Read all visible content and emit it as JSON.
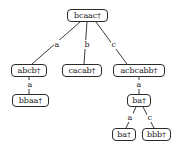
{
  "diagram": {
    "type": "tree",
    "title": "",
    "node_shape": "rounded-rectangle",
    "colors": {
      "background": "#ffffff",
      "node_fill": "#ffffff",
      "node_stroke": "#2b2b2b",
      "edge_stroke": "#3a3a3a",
      "text": "#1a1a1a"
    },
    "nodes": [
      {
        "id": "n0",
        "label": "bcaac†",
        "level": 0,
        "x": 67,
        "y": 9,
        "w": 41
      },
      {
        "id": "n1",
        "label": "abcb†",
        "level": 1,
        "x": 11,
        "y": 64,
        "w": 36
      },
      {
        "id": "n2",
        "label": "cacab†",
        "level": 1,
        "x": 62,
        "y": 64,
        "w": 40
      },
      {
        "id": "n3",
        "label": "acbcabb†",
        "level": 1,
        "x": 113,
        "y": 64,
        "w": 52
      },
      {
        "id": "n4",
        "label": "bbaa†",
        "level": 2,
        "x": 12,
        "y": 94,
        "w": 37
      },
      {
        "id": "n5",
        "label": "ba†",
        "level": 2,
        "x": 127,
        "y": 94,
        "w": 24
      },
      {
        "id": "n6",
        "label": "ba†",
        "level": 3,
        "x": 112,
        "y": 128,
        "w": 24
      },
      {
        "id": "n7",
        "label": "bbb†",
        "level": 3,
        "x": 142,
        "y": 128,
        "w": 29
      }
    ],
    "edges": [
      {
        "from": "n0",
        "to": "n1",
        "label": "a",
        "label_x": 54,
        "label_y": 40
      },
      {
        "from": "n0",
        "to": "n2",
        "label": "b",
        "label_x": 84,
        "label_y": 40
      },
      {
        "from": "n0",
        "to": "n3",
        "label": "c",
        "label_x": 111,
        "label_y": 40
      },
      {
        "from": "n1",
        "to": "n4",
        "label": "a",
        "label_x": 27,
        "label_y": 80
      },
      {
        "from": "n3",
        "to": "n5",
        "label": "a",
        "label_x": 136,
        "label_y": 80
      },
      {
        "from": "n5",
        "to": "n6",
        "label": "a",
        "label_x": 127,
        "label_y": 113
      },
      {
        "from": "n5",
        "to": "n7",
        "label": "c",
        "label_x": 147,
        "label_y": 113
      }
    ]
  }
}
